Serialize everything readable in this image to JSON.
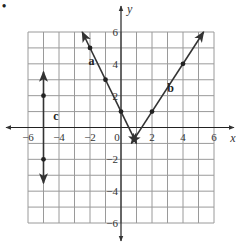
{
  "item_marker": "•",
  "chart_data": {
    "type": "line",
    "title": "",
    "xlabel": "x",
    "ylabel": "y",
    "xlim": [
      -6,
      6
    ],
    "ylim": [
      -6,
      6
    ],
    "grid": true,
    "grid_step": 1,
    "x_ticks": [
      -6,
      -4,
      -2,
      0,
      2,
      4,
      6
    ],
    "y_ticks": [
      6,
      4,
      2,
      -2,
      -4,
      -6
    ],
    "x_tick_labels": [
      "−6",
      "−4",
      "−2",
      "0",
      "2",
      "4",
      "6"
    ],
    "y_tick_labels": [
      "6",
      "4",
      "2",
      "−2",
      "−4",
      "−6"
    ],
    "series": [
      {
        "name": "a",
        "description": "line with slope -2, y-intercept 1",
        "points": [
          [
            -2,
            5
          ],
          [
            -1,
            3
          ],
          [
            0,
            1
          ]
        ],
        "segment": [
          [
            -2.5,
            6
          ],
          [
            1,
            -1
          ]
        ],
        "arrows": "both"
      },
      {
        "name": "b",
        "description": "line with slope 3/2 through (2,1) and (4,4)",
        "points": [
          [
            2,
            1
          ],
          [
            4,
            4
          ]
        ],
        "segment": [
          [
            0.67,
            -1
          ],
          [
            5.33,
            6
          ]
        ],
        "arrows": "both"
      },
      {
        "name": "c",
        "description": "vertical line x = -5",
        "points": [
          [
            -5,
            2
          ],
          [
            -5,
            -2
          ]
        ],
        "segment": [
          [
            -5,
            3.5
          ],
          [
            -5,
            -3.5
          ]
        ],
        "arrows": "both"
      }
    ],
    "legend": "none",
    "line_labels": [
      {
        "text": "a",
        "x": -1.9,
        "y": 3.9
      },
      {
        "text": "b",
        "x": 3.2,
        "y": 2.2
      },
      {
        "text": "c",
        "x": -4.2,
        "y": 0.5
      }
    ]
  }
}
